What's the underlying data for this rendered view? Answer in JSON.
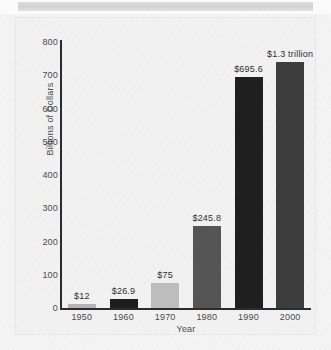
{
  "chart_data": {
    "type": "bar",
    "title": "",
    "xlabel": "Year",
    "ylabel": "Billions of Dollars",
    "categories": [
      "1950",
      "1960",
      "1970",
      "1980",
      "1990",
      "2000"
    ],
    "values": [
      12,
      26.9,
      75,
      245.8,
      695.6,
      1300
    ],
    "plotted_values": [
      12,
      26.9,
      75,
      245.8,
      695.6,
      740
    ],
    "value_labels": [
      "$12",
      "$26.9",
      "$75",
      "$245.8",
      "$695.6",
      "$1.3 trillion"
    ],
    "bar_colors": [
      "#b5b5b5",
      "#1d1d1d",
      "#bdbdbd",
      "#555555",
      "#1f1f1f",
      "#3d3d3d"
    ],
    "ylim": [
      0,
      800
    ],
    "yticks": [
      0,
      100,
      200,
      300,
      400,
      500,
      600,
      700,
      800
    ],
    "ytick_labels": [
      "0",
      "100",
      "200",
      "300",
      "400",
      "500",
      "600",
      "700",
      "800"
    ],
    "grid": false,
    "legend": "none"
  },
  "panel": {
    "background_color": "#f2f2f2",
    "axis_color": "#2b2b2b",
    "text_color": "#4a4a4a"
  },
  "banner": {
    "color": "#d6d6d6"
  }
}
